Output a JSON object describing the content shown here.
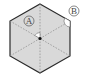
{
  "diagram": {
    "shape": "regular-hexagon",
    "fill_color": "#d9d9d9",
    "stroke_color": "#2a2a2a",
    "dash_color": "#8a8a8a",
    "center": [
      40,
      38.5
    ],
    "vertices": [
      [
        40,
        4
      ],
      [
        70,
        21
      ],
      [
        70,
        56
      ],
      [
        40,
        73
      ],
      [
        10,
        56
      ],
      [
        10,
        21
      ]
    ],
    "labels": {
      "a": {
        "text": "A",
        "position": [
          29,
          21
        ]
      },
      "b": {
        "text": "B",
        "position": [
          74,
          11
        ]
      }
    },
    "angle_markers": [
      {
        "name": "angle-a",
        "at": "center",
        "between": [
          "top",
          "upper-left"
        ]
      },
      {
        "name": "angle-b",
        "at": "upper-right-vertex",
        "between": [
          "top",
          "lower-right"
        ]
      }
    ]
  }
}
